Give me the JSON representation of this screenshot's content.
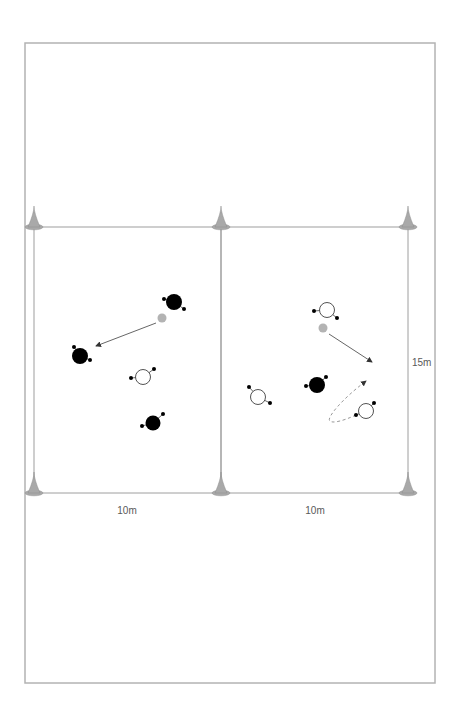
{
  "diagram": {
    "type": "soccer-drill-two-grids",
    "colors": {
      "outer_border": "#b3b3b3",
      "grid_line": "#9e9e9e",
      "cone_fill": "#a9a9a9",
      "cone_edge": "#8f8f8f",
      "ball": "#b3b3b3",
      "player_dark": "#000000",
      "player_light_fill": "#ffffff",
      "player_light_stroke": "#404040",
      "foot_dot": "#000000",
      "arrow_solid": "#555555",
      "arrow_dashed": "#8c8c8c",
      "arrowhead": "#333333",
      "label_text": "#595959"
    },
    "outer_frame": {
      "x": 25,
      "y": 43,
      "w": 410,
      "h": 640
    },
    "grids": [
      {
        "name": "left-grid",
        "x": 34,
        "y": 227,
        "w": 187,
        "h": 266
      },
      {
        "name": "right-grid",
        "x": 221,
        "y": 227,
        "w": 187,
        "h": 266
      }
    ],
    "cones": [
      {
        "x": 34,
        "y": 227
      },
      {
        "x": 221,
        "y": 227
      },
      {
        "x": 408,
        "y": 227
      },
      {
        "x": 34,
        "y": 493
      },
      {
        "x": 221,
        "y": 493
      },
      {
        "x": 408,
        "y": 493
      }
    ],
    "players": [
      {
        "id": "left-dark-top",
        "team": "dark",
        "x": 174,
        "y": 302,
        "r": 8,
        "feet": [
          [
            164,
            299
          ],
          [
            184,
            309
          ]
        ]
      },
      {
        "id": "left-dark-mid",
        "team": "dark",
        "x": 80,
        "y": 356,
        "r": 8,
        "feet": [
          [
            74,
            347
          ],
          [
            90,
            360
          ]
        ]
      },
      {
        "id": "left-light",
        "team": "light",
        "x": 143,
        "y": 377,
        "r": 7.5,
        "feet": [
          [
            131,
            378
          ],
          [
            154,
            369
          ]
        ]
      },
      {
        "id": "left-dark-bottom",
        "team": "dark",
        "x": 153,
        "y": 423,
        "r": 7.5,
        "feet": [
          [
            163,
            414
          ],
          [
            142,
            426
          ]
        ]
      },
      {
        "id": "right-light-top",
        "team": "light",
        "x": 327,
        "y": 310,
        "r": 7.5,
        "feet": [
          [
            314,
            311
          ],
          [
            337,
            318
          ]
        ]
      },
      {
        "id": "right-dark-mid",
        "team": "dark",
        "x": 317,
        "y": 385,
        "r": 8,
        "feet": [
          [
            326,
            377
          ],
          [
            306,
            386
          ]
        ]
      },
      {
        "id": "right-light-left",
        "team": "light",
        "x": 258,
        "y": 397,
        "r": 7.5,
        "feet": [
          [
            249,
            387
          ],
          [
            270,
            403
          ]
        ]
      },
      {
        "id": "right-light-bottom",
        "team": "light",
        "x": 366,
        "y": 411,
        "r": 7.5,
        "feet": [
          [
            374,
            403
          ],
          [
            356,
            415
          ]
        ]
      }
    ],
    "balls": [
      {
        "id": "left-ball",
        "x": 162,
        "y": 318,
        "r": 4.5
      },
      {
        "id": "right-ball",
        "x": 323,
        "y": 328,
        "r": 4.5
      }
    ],
    "arrows": [
      {
        "id": "left-pass-arrow",
        "style": "solid",
        "d": "M 156 323 L 96 346"
      },
      {
        "id": "right-pass-arrow",
        "style": "solid",
        "d": "M 329 334 L 372 362"
      },
      {
        "id": "right-run-arrow",
        "style": "dashed",
        "d": "M 356 415 C 343 421 331.5 424 329.5 420.5 C 327.5 417 341 400 366 381"
      }
    ],
    "dimension_labels": [
      {
        "id": "left-width-label",
        "text": "10m",
        "x": 127,
        "y": 514,
        "anchor": "middle"
      },
      {
        "id": "right-width-label",
        "text": "10m",
        "x": 315,
        "y": 514,
        "anchor": "middle"
      },
      {
        "id": "height-label",
        "text": "15m",
        "x": 412,
        "y": 366,
        "anchor": "start"
      }
    ],
    "label_font_size": 10
  }
}
